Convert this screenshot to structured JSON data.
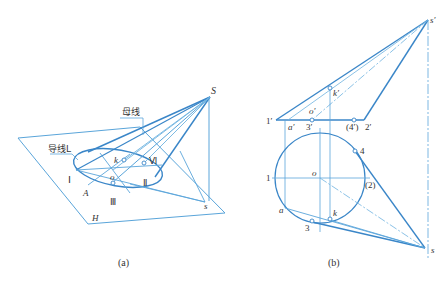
{
  "colors": {
    "line_dark": "#3a86c8",
    "line_light": "#6fb3e0",
    "text": "#333333",
    "background": "#ffffff"
  },
  "figure_a": {
    "caption": "(a)",
    "labels": {
      "apex": "S",
      "generatrix": "母线",
      "directrix": "导线L",
      "point_I": "Ⅰ",
      "point_II": "Ⅱ",
      "point_III": "Ⅲ",
      "point_VI": "Ⅵ",
      "point_A": "A",
      "center_o": "o",
      "point_k": "k",
      "proj_s": "s",
      "plane_H": "H"
    }
  },
  "figure_b": {
    "caption": "(b)",
    "labels": {
      "apex_front": "s′",
      "k_front": "k′",
      "o_front": "o′",
      "p1_front": "1′",
      "a_front": "a′",
      "p3_front": "3′",
      "p4_front": "(4′)",
      "p2_front": "2′",
      "p4_top": "4",
      "p1_top": "1",
      "center_top": "o",
      "p2_top": "(2)",
      "a_top": "a",
      "k_top": "k",
      "p3_top": "3",
      "apex_top": "s"
    }
  }
}
